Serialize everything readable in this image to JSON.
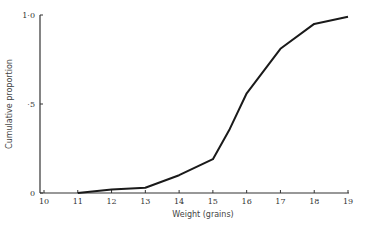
{
  "chart_data": {
    "type": "line",
    "title": "",
    "xlabel": "Weight (grains)",
    "ylabel": "Cumulative proportion",
    "x_ticks": [
      "10",
      "11",
      "12",
      "13",
      "14",
      "15",
      "16",
      "17",
      "18",
      "19"
    ],
    "y_ticks": [
      "0",
      "·5",
      "1·0"
    ],
    "xlim": [
      10,
      19
    ],
    "ylim": [
      0,
      1.0
    ],
    "grid": false,
    "legend": null,
    "series": [
      {
        "name": "Cumulative proportion",
        "x": [
          11,
          12,
          13,
          14,
          15,
          15.5,
          16,
          17,
          18,
          19
        ],
        "y": [
          0.0,
          0.02,
          0.03,
          0.1,
          0.19,
          0.36,
          0.56,
          0.81,
          0.95,
          0.99
        ]
      }
    ]
  },
  "colors": {
    "line": "#1a1a1a",
    "axis": "#333333",
    "background": "#ffffff"
  }
}
